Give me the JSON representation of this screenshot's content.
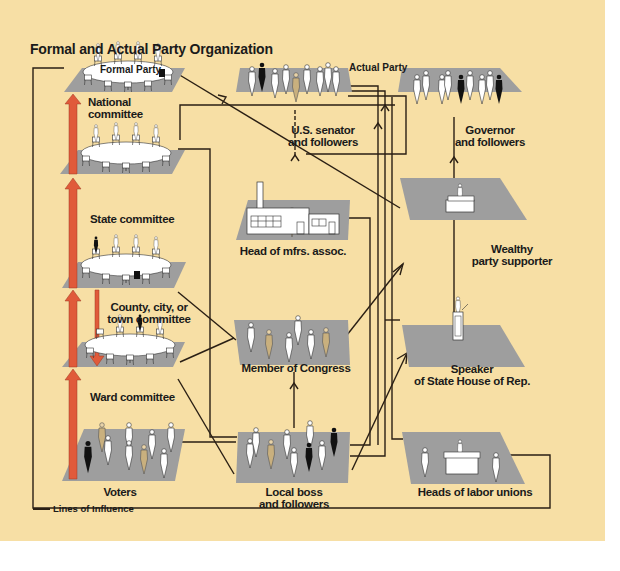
{
  "title": "Formal and Actual Party Organization",
  "columns": {
    "formal": "Formal Party",
    "actual": "Actual Party"
  },
  "colors": {
    "background": "#f7dfa5",
    "platform": "#9e9e9e",
    "line": "#2a1f14",
    "arrow": "#e05a3a"
  },
  "formal_party": [
    {
      "id": "national",
      "label": "National committee",
      "icon": "meeting-table-icon"
    },
    {
      "id": "state",
      "label": "State committee",
      "icon": "meeting-table-icon"
    },
    {
      "id": "county",
      "label": "County, city, or\ntown committee",
      "icon": "meeting-table-icon"
    },
    {
      "id": "ward",
      "label": "Ward committee",
      "icon": "meeting-table-icon"
    },
    {
      "id": "voters",
      "label": "Voters",
      "icon": "crowd-icon"
    }
  ],
  "actual_party": [
    {
      "id": "senator",
      "label": "U.S. senator\nand followers",
      "icon": "crowd-icon"
    },
    {
      "id": "governor",
      "label": "Governor\nand followers",
      "icon": "crowd-icon"
    },
    {
      "id": "mfrs",
      "label": "Head of mfrs. assoc.",
      "icon": "factory-icon"
    },
    {
      "id": "wealthy",
      "label": "Wealthy\nparty supporter",
      "icon": "desk-icon"
    },
    {
      "id": "congress",
      "label": "Member of Congress",
      "icon": "crowd-icon"
    },
    {
      "id": "speaker",
      "label": "Speaker\nof State House of Rep.",
      "icon": "podium-icon"
    },
    {
      "id": "boss",
      "label": "Local boss\nand followers",
      "icon": "crowd-icon"
    },
    {
      "id": "labor",
      "label": "Heads of labor unions",
      "icon": "desk-icon"
    }
  ],
  "legend": {
    "label": "Lines of Influence"
  }
}
